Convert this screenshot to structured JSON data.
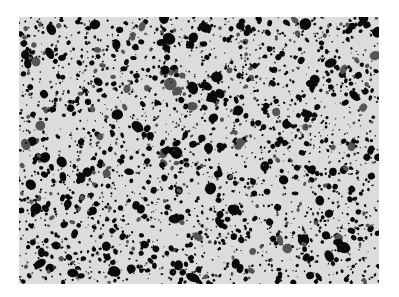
{
  "image": {
    "description": "Grayscale micrograph texture with dense black particles on light gray background",
    "background_color": "#dcdcdc",
    "particle_color": "#0a0a0a",
    "frame": {
      "x": 19,
      "y": 17,
      "width": 360,
      "height": 267
    }
  }
}
